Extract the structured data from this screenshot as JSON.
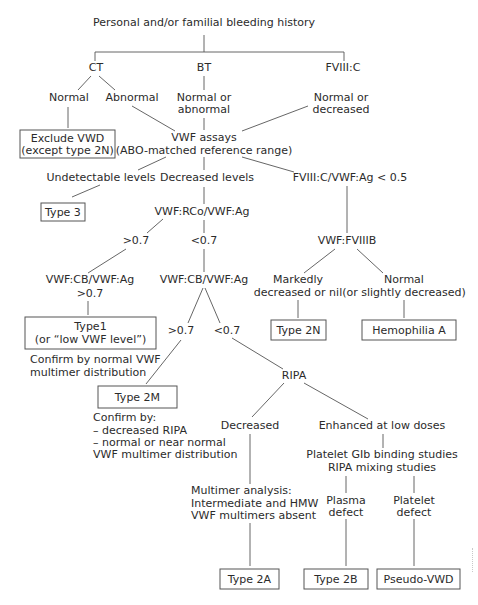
{
  "diagram": {
    "title": "Personal and/or familial bleeding history",
    "line_color": "#555555",
    "text_color": "#2b2b2b",
    "level1": {
      "ct": "CT",
      "bt": "BT",
      "fviii_c": "FVIII:C"
    },
    "level2": {
      "ct_normal": "Normal",
      "ct_abnormal": "Abnormal",
      "bt_result": [
        "Normal or",
        "abnormal"
      ],
      "fviii_result": [
        "Normal or",
        "decreased"
      ]
    },
    "exclude_box": [
      "Exclude VWD",
      "(except type 2N)"
    ],
    "vwf_assays": [
      "VWF assays",
      "(ABO-matched reference range)"
    ],
    "level3": {
      "undetectable": "Undetectable levels",
      "decreased": "Decreased levels",
      "ratio": "FVIII:C/VWF:Ag < 0.5"
    },
    "type3_box": "Type 3",
    "rco_ratio": "VWF:RCo/VWF:Ag",
    "rco_gt": ">0.7",
    "rco_lt": "<0.7",
    "fviiib": "VWF:FVIIIB",
    "cb_left": [
      "VWF:CB/VWF:Ag",
      ">0.7"
    ],
    "cb_mid": "VWF:CB/VWF:Ag",
    "fviiib_markedly": [
      "Markedly",
      "decreased or nil"
    ],
    "fviiib_normal": [
      "Normal",
      "(or slightly decreased)"
    ],
    "type1_box": [
      "Type1",
      "(or “low VWF level”)"
    ],
    "type1_confirm": [
      "Confirm by normal VWF",
      "multimer distribution"
    ],
    "cb_gt": ">0.7",
    "cb_lt": "<0.7",
    "type2n_box": "Type 2N",
    "hemophilia_box": "Hemophilia A",
    "ripa": "RIPA",
    "type2m_box": "Type 2M",
    "type2m_confirm": [
      "Confirm by:",
      "– decreased RIPA",
      "– normal or near normal",
      "VWF multimer distribution"
    ],
    "ripa_decreased": "Decreased",
    "ripa_enhanced": "Enhanced at low doses",
    "studies": [
      "Platelet GIb binding studies",
      "RIPA mixing studies"
    ],
    "multimer": [
      "Multimer analysis:",
      "Intermediate and HMW",
      "VWF multimers absent"
    ],
    "plasma_defect": [
      "Plasma",
      "defect"
    ],
    "platelet_defect": [
      "Platelet",
      "defect"
    ],
    "type2a_box": "Type 2A",
    "type2b_box": "Type 2B",
    "pseudo_box": "Pseudo-VWD"
  }
}
